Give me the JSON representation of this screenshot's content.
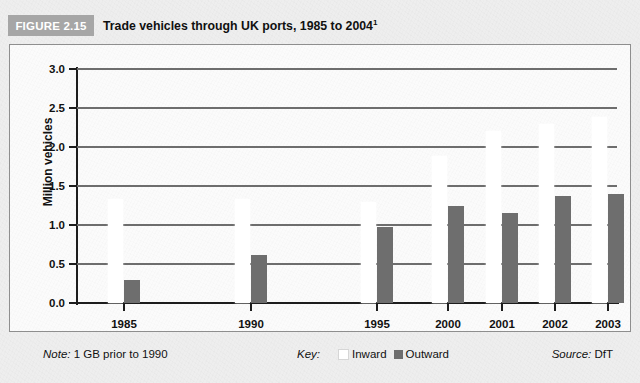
{
  "figure": {
    "tag_label": "FIGURE 2.15",
    "title": "Trade vehicles through UK ports, 1985 to 2004",
    "title_superscript": "1"
  },
  "footer": {
    "note_label": "Note:",
    "note_text": " 1 GB prior to 1990",
    "key_label": "Key:",
    "source_label": "Source:",
    "source_text": " DfT"
  },
  "colors": {
    "tag_background": "#a6a6a6",
    "outward_bar": "#6e6e6e",
    "inward_bar": "#ffffff",
    "gridline": "#6d6d6d",
    "axis": "#1d1d1d",
    "plot_background": "#fbfbfb",
    "page_background": "#eeeeee"
  },
  "chart_data": {
    "type": "bar",
    "title": "Trade vehicles through UK ports, 1985 to 2004",
    "xlabel": "",
    "ylabel": "Million vehicles",
    "ylim": [
      0.0,
      3.0
    ],
    "ytick_labels": [
      "3.0",
      "2.5",
      "2.0",
      "1.5",
      "1.0",
      "0.5",
      "0.0"
    ],
    "ytick_values": [
      3.0,
      2.5,
      2.0,
      1.5,
      1.0,
      0.5,
      0.0
    ],
    "grid": true,
    "grid_axis": "y",
    "legend_position": "bottom-center",
    "categories": [
      "1985",
      "1990",
      "1995",
      "2000",
      "2001",
      "2002",
      "2003",
      "2004"
    ],
    "series": [
      {
        "name": "Inward",
        "color": "#ffffff",
        "values": [
          1.33,
          1.33,
          1.3,
          1.88,
          2.2,
          2.3,
          2.38,
          2.5
        ]
      },
      {
        "name": "Outward",
        "color": "#6e6e6e",
        "values": [
          0.3,
          0.61,
          0.98,
          1.25,
          1.15,
          1.37,
          1.4,
          1.47
        ]
      }
    ],
    "annotations": [
      "1 GB prior to 1990"
    ],
    "source": "DfT"
  }
}
